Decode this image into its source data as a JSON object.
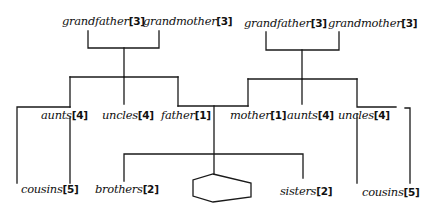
{
  "diagram": {
    "type": "family tree",
    "paternal_grandparents": [
      {
        "name": "grandfather",
        "degree": "[3]"
      },
      {
        "name": "grandmother",
        "degree": "[3]"
      }
    ],
    "maternal_grandparents": [
      {
        "name": "grandfather",
        "degree": "[3]"
      },
      {
        "name": "grandmother",
        "degree": "[3]"
      }
    ],
    "paternal_generation": [
      {
        "name": "aunts",
        "degree": "[4]"
      },
      {
        "name": "uncles",
        "degree": "[4]"
      },
      {
        "name": "father",
        "degree": "[1]"
      }
    ],
    "maternal_generation": [
      {
        "name": "mother",
        "degree": "[1]"
      },
      {
        "name": "aunts",
        "degree": "[4]"
      },
      {
        "name": "uncles",
        "degree": "[4]"
      }
    ],
    "ego_generation": [
      {
        "name": "cousins",
        "degree": "[5]"
      },
      {
        "name": "brothers",
        "degree": "[2]"
      },
      {
        "name": "sisters",
        "degree": "[2]"
      },
      {
        "name": "cousins",
        "degree": "[5]"
      }
    ],
    "ego_symbol": "hexagon",
    "line_color": "#1a1a1a"
  }
}
